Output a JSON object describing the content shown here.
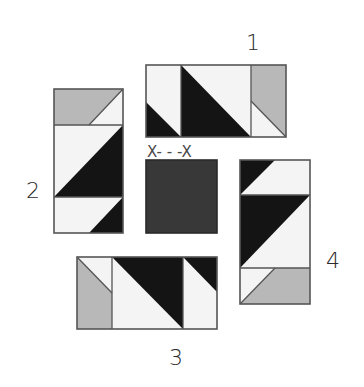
{
  "diagram": {
    "type": "quilt-block-assembly",
    "labels": {
      "unit1": "1",
      "unit2": "2",
      "unit3": "3",
      "unit4": "4",
      "seam": "X- - -X"
    },
    "colors": {
      "light": "#f4f4f4",
      "dark": "#141414",
      "gray": "#b8b8b8",
      "center": "#383838",
      "outline": "#555555"
    },
    "units": [
      {
        "id": "1",
        "position": "top",
        "orientation": "horizontal",
        "segments": [
          "light-dark lower-left triangle",
          "dark lower-left large triangle",
          "gray upper with light lower-right triangle"
        ]
      },
      {
        "id": "2",
        "position": "left",
        "orientation": "vertical",
        "segments": [
          "gray with light upper-right triangle",
          "light with dark lower-right large triangle",
          "light with dark lower-right triangle"
        ]
      },
      {
        "id": "3",
        "position": "bottom",
        "orientation": "horizontal",
        "segments": [
          "gray with light upper-left triangle",
          "dark upper-right large triangle",
          "light with dark upper-right triangle"
        ]
      },
      {
        "id": "4",
        "position": "right",
        "orientation": "vertical",
        "segments": [
          "dark upper-left triangle",
          "dark upper-left large triangle",
          "light with gray lower-right triangle"
        ]
      },
      {
        "id": "center",
        "position": "center",
        "segments": [
          "dark square"
        ]
      }
    ]
  }
}
